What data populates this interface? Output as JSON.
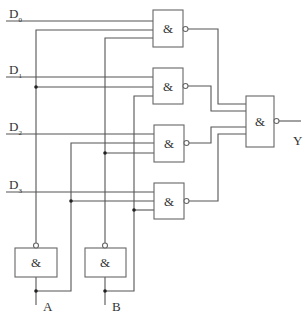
{
  "diagram": {
    "type": "logic-circuit",
    "inputs": [
      {
        "id": "D0",
        "label": "D",
        "sub": "0"
      },
      {
        "id": "D1",
        "label": "D",
        "sub": "1"
      },
      {
        "id": "D2",
        "label": "D",
        "sub": "2"
      },
      {
        "id": "D3",
        "label": "D",
        "sub": "3"
      }
    ],
    "select_inputs": [
      {
        "id": "A",
        "label": "A"
      },
      {
        "id": "B",
        "label": "B"
      }
    ],
    "output": {
      "id": "Y",
      "label": "Y"
    },
    "gate_symbol": "&",
    "gates": [
      {
        "id": "G0",
        "type": "NAND",
        "inputs": [
          "D0",
          "A'",
          "B'"
        ],
        "symbol": "&"
      },
      {
        "id": "G1",
        "type": "NAND",
        "inputs": [
          "D1",
          "A'",
          "B"
        ],
        "symbol": "&"
      },
      {
        "id": "G2",
        "type": "NAND",
        "inputs": [
          "D2",
          "A",
          "B'"
        ],
        "symbol": "&"
      },
      {
        "id": "G3",
        "type": "NAND",
        "inputs": [
          "D3",
          "A",
          "B"
        ],
        "symbol": "&"
      },
      {
        "id": "GY",
        "type": "NAND",
        "inputs": [
          "G0",
          "G1",
          "G2",
          "G3"
        ],
        "symbol": "&"
      },
      {
        "id": "INV_A",
        "type": "NOT",
        "inputs": [
          "A"
        ],
        "symbol": "&"
      },
      {
        "id": "INV_B",
        "type": "NOT",
        "inputs": [
          "B"
        ],
        "symbol": "&"
      }
    ],
    "colors": {
      "wire": "#555555",
      "background": "#ffffff"
    }
  }
}
